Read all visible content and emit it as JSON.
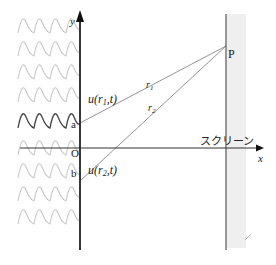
{
  "diagram": {
    "axes": {
      "y_label": "y",
      "x_label": "x",
      "origin_label": "O"
    },
    "slits": [
      {
        "id": "a",
        "label": "a",
        "wave_label": "u(r₁,t)",
        "wave_label_main": "u(",
        "wave_label_r": "r",
        "wave_label_sub": "1",
        "wave_label_tail": ",t)"
      },
      {
        "id": "b",
        "label": "b",
        "wave_label": "u(r₂,t)",
        "wave_label_main": "u(",
        "wave_label_r": "r",
        "wave_label_sub": "2",
        "wave_label_tail": ",t)"
      }
    ],
    "paths": [
      {
        "from": "a",
        "to": "P",
        "label_r": "r",
        "label_sub": "1"
      },
      {
        "from": "b",
        "to": "P",
        "label_r": "r",
        "label_sub": "2"
      }
    ],
    "point": {
      "label": "P"
    },
    "screen": {
      "label": "スクリーン"
    },
    "incident_waves": {
      "rows": 9,
      "highlighted_row": 5,
      "light_color": "#c8c8c8",
      "dark_color": "#444444"
    },
    "colors": {
      "axis": "#222222",
      "ray": "#888888",
      "screen_fill": "#eeeeee"
    }
  }
}
